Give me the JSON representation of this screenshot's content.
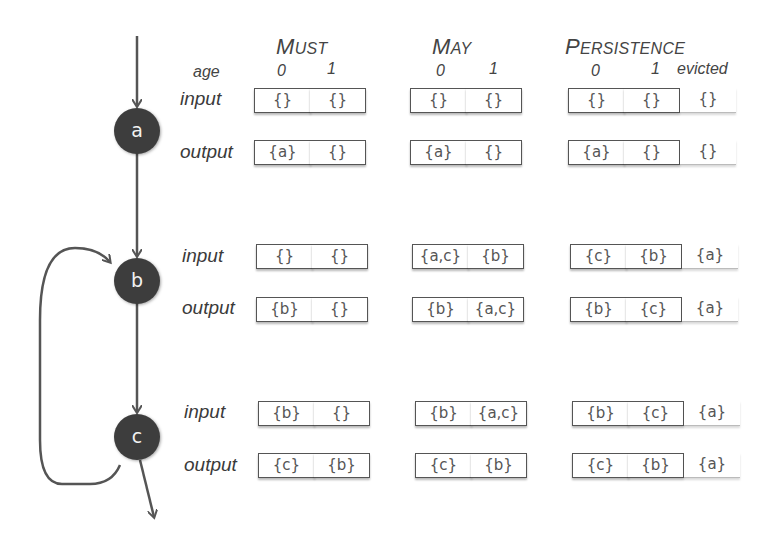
{
  "headers": {
    "must": {
      "first": "M",
      "rest": "UST"
    },
    "may": {
      "first": "M",
      "rest": "AY"
    },
    "persistence": {
      "first": "P",
      "rest": "ERSISTENCE"
    }
  },
  "age_row": {
    "label": "age",
    "must": [
      "0",
      "1"
    ],
    "may": [
      "0",
      "1"
    ],
    "persistence": [
      "0",
      "1",
      "evicted"
    ]
  },
  "nodes": [
    {
      "id": "a",
      "input_label": "input",
      "output_label": "output",
      "must": {
        "input": [
          "{}",
          "{}"
        ],
        "output": [
          "{a}",
          "{}"
        ]
      },
      "may": {
        "input": [
          "{}",
          "{}"
        ],
        "output": [
          "{a}",
          "{}"
        ]
      },
      "persistence": {
        "input": [
          "{}",
          "{}",
          "{}"
        ],
        "output": [
          "{a}",
          "{}",
          "{}"
        ]
      }
    },
    {
      "id": "b",
      "input_label": "input",
      "output_label": "output",
      "must": {
        "input": [
          "{}",
          "{}"
        ],
        "output": [
          "{b}",
          "{}"
        ]
      },
      "may": {
        "input": [
          "{a,c}",
          "{b}"
        ],
        "output": [
          "{b}",
          "{a,c}"
        ]
      },
      "persistence": {
        "input": [
          "{c}",
          "{b}",
          "{a}"
        ],
        "output": [
          "{b}",
          "{c}",
          "{a}"
        ]
      }
    },
    {
      "id": "c",
      "input_label": "input",
      "output_label": "output",
      "must": {
        "input": [
          "{b}",
          "{}"
        ],
        "output": [
          "{c}",
          "{b}"
        ]
      },
      "may": {
        "input": [
          "{b}",
          "{a,c}"
        ],
        "output": [
          "{c}",
          "{b}"
        ]
      },
      "persistence": {
        "input": [
          "{b}",
          "{c}",
          "{a}"
        ],
        "output": [
          "{c}",
          "{b}",
          "{a}"
        ]
      }
    }
  ],
  "colors": {
    "node_fill": "#3d3d3d",
    "edge": "#555555",
    "cell_border": "#555555",
    "text": "#444444"
  }
}
